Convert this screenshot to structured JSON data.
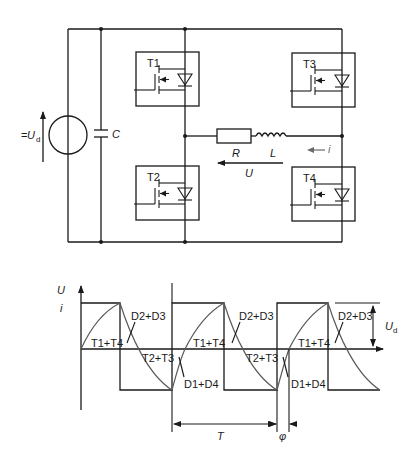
{
  "circuit": {
    "source_label_prefix": "=",
    "source_label": "U",
    "source_label_sub": "d",
    "capacitor_label": "C",
    "switches": [
      {
        "id": "T1",
        "label": "T1"
      },
      {
        "id": "T2",
        "label": "T2"
      },
      {
        "id": "T3",
        "label": "T3"
      },
      {
        "id": "T4",
        "label": "T4"
      }
    ],
    "resistor_label": "R",
    "inductor_label": "L",
    "voltage_label": "U",
    "current_label": "i"
  },
  "waveform": {
    "y_axis_label_voltage": "U",
    "y_axis_label_current": "i",
    "amplitude_label": "U",
    "amplitude_label_sub": "d",
    "period_label": "T",
    "phase_label": "φ",
    "annotations": {
      "t1t4": "T1+T4",
      "d2d3": "D2+D3",
      "t2t3": "T2+T3",
      "d1d4": "D1+D4"
    }
  },
  "colors": {
    "line": "#1a1a1a",
    "arrow_gray": "#6a6a6a",
    "background": "#ffffff"
  }
}
